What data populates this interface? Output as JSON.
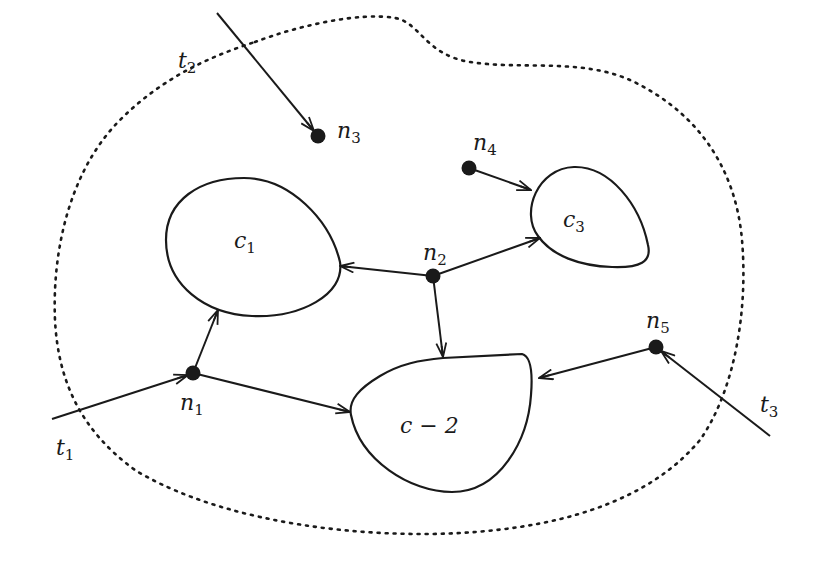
{
  "diagram": {
    "type": "network-region",
    "background": "#ffffff",
    "stroke_color": "#1a1a1a",
    "boundary": {
      "style": "dotted",
      "description": "closed region enclosing all nodes and clusters"
    },
    "clusters": [
      {
        "id": "c1",
        "label_main": "c",
        "label_sub": "1"
      },
      {
        "id": "c3",
        "label_main": "c",
        "label_sub": "3"
      },
      {
        "id": "c-2",
        "label_main": "c − 2",
        "label_sub": ""
      }
    ],
    "nodes": [
      {
        "id": "n1",
        "label_main": "n",
        "label_sub": "1"
      },
      {
        "id": "n2",
        "label_main": "n",
        "label_sub": "2"
      },
      {
        "id": "n3",
        "label_main": "n",
        "label_sub": "3"
      },
      {
        "id": "n4",
        "label_main": "n",
        "label_sub": "4"
      },
      {
        "id": "n5",
        "label_main": "n",
        "label_sub": "5"
      }
    ],
    "terminals": [
      {
        "id": "t1",
        "label_main": "t",
        "label_sub": "1",
        "target": "n1"
      },
      {
        "id": "t2",
        "label_main": "t",
        "label_sub": "2",
        "target": "n3"
      },
      {
        "id": "t3",
        "label_main": "t",
        "label_sub": "3",
        "target": "n5"
      }
    ],
    "edges": [
      {
        "from": "t1",
        "to": "n1"
      },
      {
        "from": "t2",
        "to": "n3"
      },
      {
        "from": "t3",
        "to": "n5"
      },
      {
        "from": "n1",
        "to": "c1"
      },
      {
        "from": "n1",
        "to": "c-2"
      },
      {
        "from": "n2",
        "to": "c1"
      },
      {
        "from": "n2",
        "to": "c3"
      },
      {
        "from": "n2",
        "to": "c-2"
      },
      {
        "from": "n4",
        "to": "c3"
      },
      {
        "from": "n5",
        "to": "c-2"
      }
    ]
  }
}
